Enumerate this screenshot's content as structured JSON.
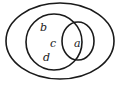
{
  "diagram": {
    "type": "venn",
    "sets": [
      {
        "name": "universe",
        "shape": "ellipse"
      },
      {
        "name": "left-set",
        "shape": "circle"
      },
      {
        "name": "right-set",
        "shape": "circle"
      }
    ],
    "labels": {
      "b": "b",
      "c": "c",
      "d": "d",
      "a": "a"
    },
    "stroke_color": "#1a1a1a"
  }
}
